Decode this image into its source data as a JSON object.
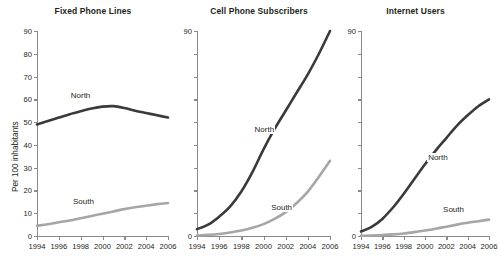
{
  "figure": {
    "y_axis_title": "Per 100 inhabitants",
    "series_names": [
      "North",
      "South"
    ],
    "colors": {
      "north": "#3a3a3a",
      "south": "#a6a6a6",
      "axis": "#8a8a8a",
      "text": "#231f20",
      "background": "#ffffff"
    }
  },
  "chart_data": [
    {
      "type": "line",
      "title": "Fixed Phone Lines",
      "xlabel": "",
      "ylabel": "Per 100 inhabitants",
      "x": [
        1994,
        1995,
        1996,
        1997,
        1998,
        1999,
        2000,
        2001,
        2002,
        2003,
        2004,
        2005,
        2006
      ],
      "xlim": [
        1994,
        2006
      ],
      "ylim": [
        0,
        90
      ],
      "xticks": [
        1994,
        1996,
        1998,
        2000,
        2002,
        2004,
        2006
      ],
      "xticklabels": [
        "1994",
        "1996",
        "1998",
        "2000",
        "2002",
        "2004",
        "2006"
      ],
      "yticks": [
        0,
        10,
        20,
        30,
        40,
        50,
        60,
        70,
        80,
        90
      ],
      "yticklabels": [
        "0",
        "10",
        "20",
        "30",
        "40",
        "50",
        "60",
        "70",
        "80",
        "90"
      ],
      "grid": false,
      "legend": "inline-annotations",
      "series": [
        {
          "name": "North",
          "color": "#3a3a3a",
          "values": [
            49,
            50.5,
            52,
            53.5,
            54.8,
            56,
            56.8,
            57,
            56.2,
            55,
            54,
            53,
            52
          ]
        },
        {
          "name": "South",
          "color": "#a6a6a6",
          "values": [
            4.5,
            5.2,
            6,
            6.8,
            7.8,
            8.8,
            9.8,
            10.8,
            11.8,
            12.6,
            13.3,
            14,
            14.5
          ]
        }
      ],
      "annotations": [
        {
          "text": "North",
          "x": 1997,
          "y": 61
        },
        {
          "text": "South",
          "x": 1997.2,
          "y": 14.5
        }
      ]
    },
    {
      "type": "line",
      "title": "Cell Phone Subscribers",
      "xlabel": "",
      "ylabel": "",
      "x": [
        1994,
        1995,
        1996,
        1997,
        1998,
        1999,
        2000,
        2001,
        2002,
        2003,
        2004,
        2005,
        2006
      ],
      "xlim": [
        1994,
        2006
      ],
      "ylim": [
        0,
        90
      ],
      "xticks": [
        1994,
        1996,
        1998,
        2000,
        2002,
        2004,
        2006
      ],
      "xticklabels": [
        "1994",
        "1996",
        "1998",
        "2000",
        "2002",
        "2004",
        "2006"
      ],
      "yticks": [
        0,
        10,
        20,
        30,
        40,
        50,
        60,
        70,
        80,
        90
      ],
      "yticklabels": [
        "0",
        "",
        "",
        "",
        "",
        "",
        "",
        "",
        "",
        "90"
      ],
      "grid": false,
      "legend": "inline-annotations",
      "series": [
        {
          "name": "North",
          "color": "#3a3a3a",
          "values": [
            3,
            5,
            8.5,
            13,
            19.5,
            28,
            38,
            47,
            55,
            63,
            71,
            80,
            90
          ]
        },
        {
          "name": "South",
          "color": "#a6a6a6",
          "values": [
            0.2,
            0.5,
            0.9,
            1.5,
            2.4,
            3.6,
            5.2,
            7.5,
            10.5,
            14.5,
            19.5,
            26,
            33
          ]
        }
      ],
      "annotations": [
        {
          "text": "North",
          "x": 1999.1,
          "y": 46
        },
        {
          "text": "South",
          "x": 2000.6,
          "y": 12
        }
      ]
    },
    {
      "type": "line",
      "title": "Internet Users",
      "xlabel": "",
      "ylabel": "",
      "x": [
        1994,
        1995,
        1996,
        1997,
        1998,
        1999,
        2000,
        2001,
        2002,
        2003,
        2004,
        2005,
        2006
      ],
      "xlim": [
        1994,
        2006
      ],
      "ylim": [
        0,
        90
      ],
      "xticks": [
        1994,
        1996,
        1998,
        2000,
        2002,
        2004,
        2006
      ],
      "xticklabels": [
        "1994",
        "1996",
        "1998",
        "2000",
        "2002",
        "2004",
        "2006"
      ],
      "yticks": [
        0,
        10,
        20,
        30,
        40,
        50,
        60,
        70,
        80,
        90
      ],
      "yticklabels": [
        "0",
        "",
        "",
        "",
        "",
        "",
        "",
        "",
        "",
        "90"
      ],
      "grid": false,
      "legend": "inline-annotations",
      "series": [
        {
          "name": "North",
          "color": "#3a3a3a",
          "values": [
            2,
            4,
            7.5,
            12.5,
            18.5,
            25,
            31.5,
            37.5,
            43,
            48.5,
            53,
            57,
            60
          ]
        },
        {
          "name": "South",
          "color": "#a6a6a6",
          "values": [
            0.1,
            0.2,
            0.4,
            0.7,
            1.1,
            1.7,
            2.4,
            3.2,
            4.1,
            5,
            5.8,
            6.5,
            7.2
          ]
        }
      ],
      "annotations": [
        {
          "text": "North",
          "x": 2000.2,
          "y": 34
        },
        {
          "text": "South",
          "x": 2001.6,
          "y": 11
        }
      ]
    }
  ]
}
